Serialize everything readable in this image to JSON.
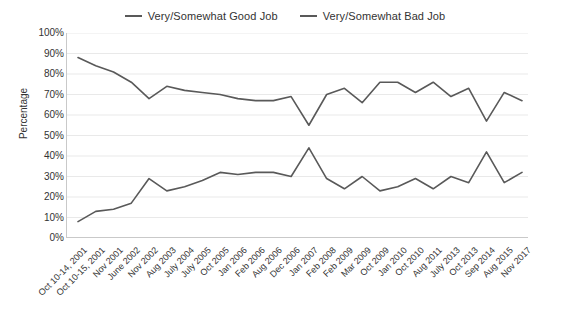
{
  "chart_data": {
    "type": "line",
    "title": "",
    "xlabel": "",
    "ylabel": "Percentage",
    "ylim": [
      0,
      100
    ],
    "ytick_labels": [
      "100%",
      "90%",
      "80%",
      "70%",
      "60%",
      "50%",
      "40%",
      "30%",
      "20%",
      "10%",
      "0%"
    ],
    "ytick_values": [
      100,
      90,
      80,
      70,
      60,
      50,
      40,
      30,
      20,
      10,
      0
    ],
    "grid": true,
    "legend_position": "top-center",
    "categories": [
      "Oct 10-14, 2001",
      "Oct 10-15, 2001",
      "Nov 2001",
      "June 2002",
      "Nov 2002",
      "Aug 2003",
      "July 2004",
      "July 2005",
      "Oct 2005",
      "Jan 2006",
      "Feb 2006",
      "Aug 2006",
      "Dec 2006",
      "Jan 2007",
      "Feb 2008",
      "Feb 2009",
      "Mar 2009",
      "Oct 2009",
      "Jan 2010",
      "Oct 2010",
      "Aug 2011",
      "July 2013",
      "Oct 2013",
      "Sep 2014",
      "Aug 2015",
      "Nov 2017"
    ],
    "series": [
      {
        "name": "Very/Somewhat Good Job",
        "color": "#595959",
        "values": [
          88,
          84,
          81,
          76,
          68,
          74,
          72,
          71,
          70,
          68,
          67,
          67,
          69,
          55,
          70,
          73,
          66,
          76,
          76,
          71,
          76,
          69,
          73,
          57,
          71,
          67
        ]
      },
      {
        "name": "Very/Somewhat Bad Job",
        "color": "#595959",
        "values": [
          8,
          13,
          14,
          17,
          29,
          23,
          25,
          28,
          32,
          31,
          32,
          32,
          30,
          44,
          29,
          24,
          30,
          23,
          25,
          29,
          24,
          30,
          27,
          42,
          27,
          32
        ]
      }
    ]
  },
  "legend": {
    "items": [
      {
        "label": "Very/Somewhat Good Job"
      },
      {
        "label": "Very/Somewhat Bad Job"
      }
    ]
  },
  "axes": {
    "y_title": "Percentage"
  },
  "colors": {
    "line": "#595959",
    "grid": "#e9e9e9",
    "axis": "#c9c9c9",
    "text": "#333333"
  }
}
